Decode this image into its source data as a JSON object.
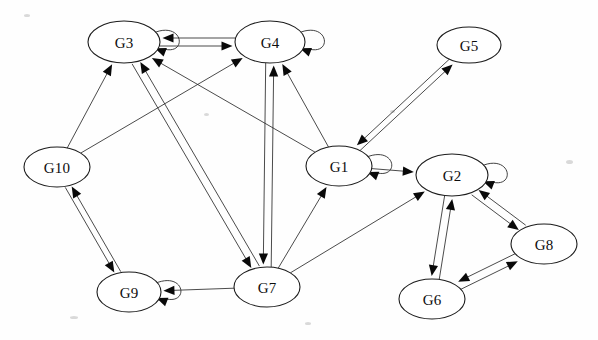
{
  "diagram": {
    "type": "directed-graph",
    "background_color": "#fefefe",
    "node_fill": "#ffffff",
    "node_stroke": "#1c1c1c",
    "edge_color": "#2b2b2b",
    "arrow_color": "#090909",
    "nodes": [
      {
        "id": "G1",
        "label": "G1",
        "cx": 339,
        "cy": 166,
        "rx": 33,
        "ry": 20,
        "self_loop": true,
        "loop_side": "right"
      },
      {
        "id": "G2",
        "label": "G2",
        "cx": 452,
        "cy": 175,
        "rx": 36,
        "ry": 21,
        "self_loop": true,
        "loop_side": "right"
      },
      {
        "id": "G3",
        "label": "G3",
        "cx": 124,
        "cy": 42,
        "rx": 36,
        "ry": 21,
        "self_loop": true,
        "loop_side": "right"
      },
      {
        "id": "G4",
        "label": "G4",
        "cx": 270,
        "cy": 42,
        "rx": 35,
        "ry": 21,
        "self_loop": true,
        "loop_side": "right"
      },
      {
        "id": "G5",
        "label": "G5",
        "cx": 469,
        "cy": 45,
        "rx": 32,
        "ry": 18,
        "self_loop": false,
        "loop_side": ""
      },
      {
        "id": "G6",
        "label": "G6",
        "cx": 432,
        "cy": 299,
        "rx": 33,
        "ry": 20,
        "self_loop": false,
        "loop_side": ""
      },
      {
        "id": "G7",
        "label": "G7",
        "cx": 267,
        "cy": 287,
        "rx": 33,
        "ry": 20,
        "self_loop": false,
        "loop_side": ""
      },
      {
        "id": "G8",
        "label": "G8",
        "cx": 544,
        "cy": 244,
        "rx": 33,
        "ry": 20,
        "self_loop": false,
        "loop_side": ""
      },
      {
        "id": "G9",
        "label": "G9",
        "cx": 129,
        "cy": 292,
        "rx": 32,
        "ry": 20,
        "self_loop": true,
        "loop_side": "right"
      },
      {
        "id": "G10",
        "label": "G10",
        "cx": 57,
        "cy": 167,
        "rx": 33,
        "ry": 20,
        "self_loop": false,
        "loop_side": ""
      }
    ],
    "edges": [
      {
        "from": "G3",
        "to": "G4",
        "bidirectional": true,
        "offset": 4
      },
      {
        "from": "G3",
        "to": "G7",
        "bidirectional": true,
        "offset": 4
      },
      {
        "from": "G4",
        "to": "G7",
        "bidirectional": true,
        "offset": 4
      },
      {
        "from": "G10",
        "to": "G3",
        "bidirectional": false,
        "offset": 0
      },
      {
        "from": "G10",
        "to": "G4",
        "bidirectional": false,
        "offset": 0
      },
      {
        "from": "G1",
        "to": "G3",
        "bidirectional": false,
        "offset": 0
      },
      {
        "from": "G1",
        "to": "G4",
        "bidirectional": false,
        "offset": 0
      },
      {
        "from": "G1",
        "to": "G5",
        "bidirectional": true,
        "offset": 3
      },
      {
        "from": "G1",
        "to": "G2",
        "bidirectional": false,
        "offset": 0
      },
      {
        "from": "G7",
        "to": "G1",
        "bidirectional": false,
        "offset": 0
      },
      {
        "from": "G7",
        "to": "G2",
        "bidirectional": false,
        "offset": 0
      },
      {
        "from": "G7",
        "to": "G9",
        "bidirectional": false,
        "offset": 0
      },
      {
        "from": "G10",
        "to": "G9",
        "bidirectional": true,
        "offset": 3
      },
      {
        "from": "G2",
        "to": "G6",
        "bidirectional": true,
        "offset": 4
      },
      {
        "from": "G2",
        "to": "G8",
        "bidirectional": true,
        "offset": 4
      },
      {
        "from": "G6",
        "to": "G8",
        "bidirectional": true,
        "offset": 4
      }
    ],
    "self_loops": [
      "G1",
      "G2",
      "G3",
      "G4",
      "G9"
    ],
    "specks": [
      {
        "x": 24,
        "y": 14,
        "w": 6,
        "h": 3
      },
      {
        "x": 566,
        "y": 160,
        "w": 7,
        "h": 4
      },
      {
        "x": 70,
        "y": 316,
        "w": 8,
        "h": 3
      },
      {
        "x": 305,
        "y": 322,
        "w": 6,
        "h": 3
      },
      {
        "x": 204,
        "y": 113,
        "w": 5,
        "h": 3
      },
      {
        "x": 390,
        "y": 110,
        "w": 5,
        "h": 3
      }
    ]
  }
}
